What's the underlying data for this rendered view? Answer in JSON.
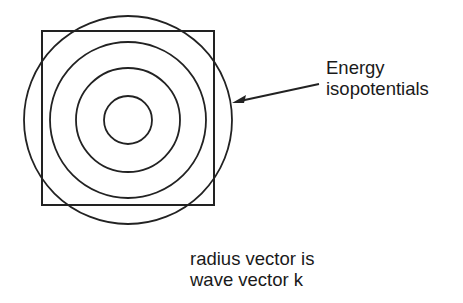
{
  "diagram": {
    "square": {
      "x": 42,
      "y": 31,
      "size": 172
    },
    "center": {
      "x": 128,
      "y": 120
    },
    "circle_radii": [
      24,
      52,
      78,
      104
    ],
    "stroke_color": "#222222",
    "arrow": {
      "from": [
        319,
        84
      ],
      "to": [
        233,
        102
      ]
    },
    "label": {
      "line1": "Energy",
      "line2": "isopotentials"
    },
    "caption": {
      "line1": "radius vector is",
      "line2": "wave vector k"
    }
  }
}
